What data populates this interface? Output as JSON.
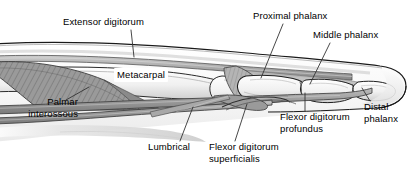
{
  "figure": {
    "type": "anatomical-illustration",
    "width": 412,
    "height": 174,
    "background_color": "#ffffff",
    "ink_color": "#000000",
    "palette": {
      "skin_outline": "#1a1a1a",
      "bone_fill": "#f2f2f2",
      "bone_shade": "#d9d9d9",
      "tendon_fill": "#9e9e9e",
      "tendon_dark": "#6e6e6e",
      "muscle_fill": "#8c8c8c",
      "soft_tissue": "#e8e8e8",
      "leader_line": "#333333"
    }
  },
  "labels": [
    {
      "id": "extensor-digitorum",
      "text": "Extensor digitorum",
      "lines": [
        "Extensor digitorum"
      ],
      "x": 63,
      "y": 17,
      "align": "left",
      "boxed": false,
      "leader": {
        "x1": 131,
        "y1": 30,
        "x2": 134,
        "y2": 57
      }
    },
    {
      "id": "metacarpal",
      "text": "Metacarpal",
      "lines": [
        "Metacarpal"
      ],
      "x": 116,
      "y": 69,
      "align": "left",
      "boxed": true,
      "leader": null
    },
    {
      "id": "palmar-interossous",
      "text": "Palmar interossous",
      "lines": [
        "Palmar",
        "interossous"
      ],
      "x": 14,
      "y": 97,
      "align": "right",
      "boxed": false,
      "leader": {
        "x1": 66,
        "y1": 100,
        "x2": 89,
        "y2": 87
      }
    },
    {
      "id": "proximal-phalanx",
      "text": "Proximal phalanx",
      "lines": [
        "Proximal phalanx"
      ],
      "x": 253,
      "y": 11,
      "align": "left",
      "boxed": false,
      "leader": {
        "x1": 283,
        "y1": 24,
        "x2": 261,
        "y2": 78
      }
    },
    {
      "id": "middle-phalanx",
      "text": "Middle phalanx",
      "lines": [
        "Middle phalanx"
      ],
      "x": 313,
      "y": 30,
      "align": "left",
      "boxed": false,
      "leader": {
        "x1": 330,
        "y1": 43,
        "x2": 310,
        "y2": 84
      }
    },
    {
      "id": "distal-phalanx",
      "text": "Distal phalanx",
      "lines": [
        "Distal",
        "phalanx"
      ],
      "x": 363,
      "y": 102,
      "align": "left",
      "boxed": false,
      "leader": {
        "x1": 370,
        "y1": 101,
        "x2": 362,
        "y2": 88
      }
    },
    {
      "id": "flexor-digitorum-profundus",
      "text": "Flexor digitorum profundus",
      "lines": [
        "Flexor digitorum",
        "profundus"
      ],
      "x": 280,
      "y": 112,
      "align": "left",
      "boxed": false,
      "leader": {
        "x1": 305,
        "y1": 111,
        "x2": 305,
        "y2": 93
      }
    },
    {
      "id": "flexor-digitorum-superficialis",
      "text": "Flexor digitorum superficialis",
      "lines": [
        "Flexor digitorum",
        "superficialis"
      ],
      "x": 209,
      "y": 142,
      "align": "left",
      "boxed": false,
      "leader": {
        "x1": 235,
        "y1": 141,
        "x2": 247,
        "y2": 104
      }
    },
    {
      "id": "lumbrical",
      "text": "Lumbrical",
      "lines": [
        "Lumbrical"
      ],
      "x": 148,
      "y": 142,
      "align": "left",
      "boxed": false,
      "leader": {
        "x1": 180,
        "y1": 141,
        "x2": 193,
        "y2": 107
      }
    }
  ],
  "structures": [
    {
      "id": "skin-outline",
      "name": "skin-outline",
      "kind": "contour"
    },
    {
      "id": "extensor-tendon",
      "name": "extensor-digitorum-tendon",
      "kind": "tendon"
    },
    {
      "id": "metacarpal-bone",
      "name": "metacarpal-bone",
      "kind": "bone"
    },
    {
      "id": "proximal-phalanx-bone",
      "name": "proximal-phalanx-bone",
      "kind": "bone"
    },
    {
      "id": "middle-phalanx-bone",
      "name": "middle-phalanx-bone",
      "kind": "bone"
    },
    {
      "id": "distal-phalanx-bone",
      "name": "distal-phalanx-bone",
      "kind": "bone"
    },
    {
      "id": "palmar-interosseous-muscle",
      "name": "palmar-interossous-muscle",
      "kind": "muscle"
    },
    {
      "id": "lumbrical-muscle",
      "name": "lumbrical-muscle",
      "kind": "muscle"
    },
    {
      "id": "fdp-tendon",
      "name": "flexor-digitorum-profundus-tendon",
      "kind": "tendon"
    },
    {
      "id": "fds-tendon",
      "name": "flexor-digitorum-superficialis-tendon",
      "kind": "tendon"
    }
  ]
}
